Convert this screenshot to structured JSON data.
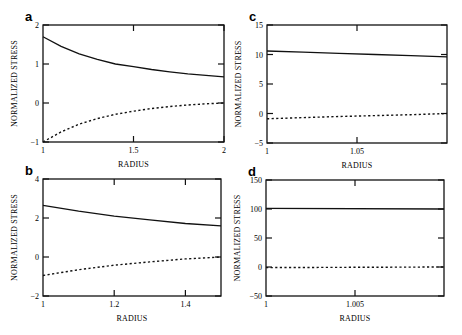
{
  "chart_data": [
    {
      "panel": "a",
      "type": "line",
      "xlabel": "RADIUS",
      "ylabel": "NORMALIZED STRESS",
      "xlim": [
        1,
        2
      ],
      "ylim": [
        -1,
        2
      ],
      "xticks": [
        "1",
        "1.5",
        "2"
      ],
      "yticks": [
        "-1",
        "0",
        "1",
        "2"
      ],
      "box": [
        43,
        25,
        224,
        142
      ],
      "series": [
        {
          "name": "solid",
          "style": "solid",
          "x": [
            1,
            1.1,
            1.2,
            1.3,
            1.4,
            1.5,
            1.6,
            1.7,
            1.8,
            1.9,
            2
          ],
          "values": [
            1.7,
            1.45,
            1.26,
            1.12,
            1.0,
            0.93,
            0.86,
            0.8,
            0.75,
            0.71,
            0.67
          ]
        },
        {
          "name": "dotted",
          "style": "dotted",
          "x": [
            1,
            1.1,
            1.2,
            1.3,
            1.4,
            1.5,
            1.6,
            1.7,
            1.8,
            1.9,
            2
          ],
          "values": [
            -1.0,
            -0.74,
            -0.54,
            -0.4,
            -0.29,
            -0.21,
            -0.14,
            -0.09,
            -0.05,
            -0.02,
            0.0
          ]
        }
      ]
    },
    {
      "panel": "b",
      "type": "line",
      "xlabel": "RADIUS",
      "ylabel": "NORMALIZED STRESS",
      "xlim": [
        1,
        1.5
      ],
      "ylim": [
        -2,
        4
      ],
      "xticks": [
        "1",
        "1.2",
        "1.4"
      ],
      "yticks": [
        "-2",
        "0",
        "2",
        "4"
      ],
      "box": [
        43,
        179,
        221,
        296
      ],
      "series": [
        {
          "name": "solid",
          "style": "solid",
          "x": [
            1,
            1.1,
            1.2,
            1.3,
            1.4,
            1.5
          ],
          "values": [
            2.65,
            2.35,
            2.1,
            1.9,
            1.72,
            1.6
          ]
        },
        {
          "name": "dotted",
          "style": "dotted",
          "x": [
            1,
            1.1,
            1.2,
            1.3,
            1.4,
            1.5
          ],
          "values": [
            -0.95,
            -0.65,
            -0.42,
            -0.25,
            -0.1,
            0.0
          ]
        }
      ]
    },
    {
      "panel": "c",
      "type": "line",
      "xlabel": "RADIUS",
      "ylabel": "NORMALIZED STRESS",
      "xlim": [
        1,
        1.1
      ],
      "ylim": [
        -5,
        15
      ],
      "xticks": [
        "1",
        "1.05"
      ],
      "yticks": [
        "-5",
        "0",
        "5",
        "10",
        "15"
      ],
      "box": [
        267,
        25,
        447,
        143
      ],
      "series": [
        {
          "name": "solid",
          "style": "solid",
          "x": [
            1,
            1.02,
            1.04,
            1.06,
            1.08,
            1.1
          ],
          "values": [
            10.6,
            10.4,
            10.2,
            10.0,
            9.8,
            9.6
          ]
        },
        {
          "name": "dotted",
          "style": "dotted",
          "x": [
            1,
            1.02,
            1.04,
            1.06,
            1.08,
            1.1
          ],
          "values": [
            -0.9,
            -0.7,
            -0.5,
            -0.35,
            -0.2,
            0.0
          ]
        }
      ]
    },
    {
      "panel": "d",
      "type": "line",
      "xlabel": "RADIUS",
      "ylabel": "NORMALIZED STRESS",
      "xlim": [
        1,
        1.01
      ],
      "ylim": [
        -50,
        150
      ],
      "xticks": [
        "1",
        "1.005"
      ],
      "yticks": [
        "-50",
        "0",
        "50",
        "100",
        "150"
      ],
      "box": [
        266,
        180,
        444,
        296
      ],
      "series": [
        {
          "name": "solid",
          "style": "solid",
          "x": [
            1,
            1.01
          ],
          "values": [
            101,
            100
          ]
        },
        {
          "name": "dotted",
          "style": "dotted",
          "x": [
            1,
            1.01
          ],
          "values": [
            -1,
            0
          ]
        }
      ]
    }
  ]
}
